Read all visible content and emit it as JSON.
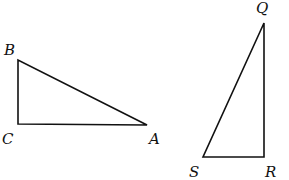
{
  "figure": {
    "triangles": [
      {
        "name": "ABC",
        "right_angle_at": "C",
        "vertices": [
          {
            "label": "A",
            "x": 147,
            "y": 125,
            "label_x": 149,
            "label_y": 144
          },
          {
            "label": "B",
            "x": 18,
            "y": 60,
            "label_x": 4,
            "label_y": 55
          },
          {
            "label": "C",
            "x": 18,
            "y": 124,
            "label_x": 2,
            "label_y": 144
          }
        ]
      },
      {
        "name": "QRS",
        "right_angle_at": "R",
        "vertices": [
          {
            "label": "Q",
            "x": 264,
            "y": 23,
            "label_x": 256,
            "label_y": 13
          },
          {
            "label": "R",
            "x": 264,
            "y": 157,
            "label_x": 265,
            "label_y": 177
          },
          {
            "label": "S",
            "x": 203,
            "y": 157,
            "label_x": 189,
            "label_y": 177
          }
        ]
      }
    ]
  }
}
